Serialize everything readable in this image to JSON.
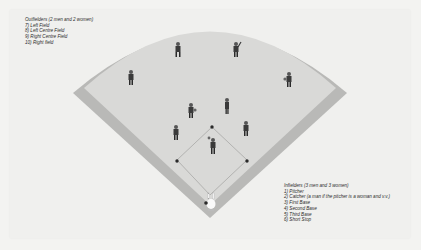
{
  "diagram": {
    "type": "softball field positions",
    "colors": {
      "background": "#f3f3f1",
      "outfield": "#d9d9d7",
      "foul_strip": "#b9b9b7",
      "infield": "#e2e2e0",
      "base": "#2a2a2a",
      "text": "#2b2b2b"
    }
  },
  "outfielders": {
    "title": "Outfielders (2 men and 2 women)",
    "items": [
      "7) Left Field",
      "8) Left Centre Field",
      "9) Right Centre Field",
      "10) Right field"
    ]
  },
  "infielders": {
    "title": "Infielders (3 men and 3 women)",
    "items": [
      "1) Pitcher",
      "2) Catcher (a man if the pitcher is a woman and v.v.)",
      "3) First Base",
      "4) Second Base",
      "5) Third Base",
      "6) Short Stop"
    ]
  },
  "players": [
    {
      "position": "Left Field",
      "icon": "player-figure-icon"
    },
    {
      "position": "Left Centre Field",
      "icon": "player-figure-icon"
    },
    {
      "position": "Right Centre Field",
      "icon": "player-figure-icon"
    },
    {
      "position": "Right Field",
      "icon": "player-figure-icon"
    },
    {
      "position": "Short Stop",
      "icon": "player-figure-icon"
    },
    {
      "position": "Second Base",
      "icon": "player-figure-icon"
    },
    {
      "position": "Third Base",
      "icon": "player-figure-icon"
    },
    {
      "position": "First Base",
      "icon": "player-figure-icon"
    },
    {
      "position": "Pitcher",
      "icon": "player-figure-icon"
    },
    {
      "position": "Catcher",
      "icon": "catcher-figure-icon"
    }
  ]
}
